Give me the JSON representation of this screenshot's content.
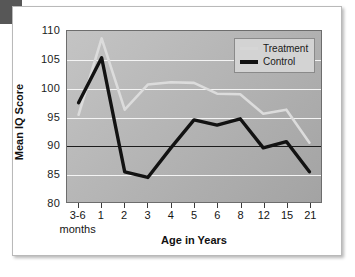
{
  "figure": {
    "corner_marker": "corner-block"
  },
  "chart_data": {
    "type": "line",
    "title": "",
    "xlabel": "Age in Years",
    "ylabel": "Mean IQ Score",
    "x_sub_label": "months",
    "categories": [
      "3-6",
      "1",
      "2",
      "3",
      "4",
      "5",
      "6",
      "8",
      "12",
      "15",
      "21"
    ],
    "ylim": [
      80,
      110
    ],
    "yticks": [
      110,
      105,
      100,
      95,
      90,
      85,
      80
    ],
    "grid": true,
    "reference_line": 90,
    "legend_position": "top-right",
    "series": [
      {
        "name": "Treatment",
        "color": "#dcdcdc",
        "values": [
          95.3,
          108.7,
          96.2,
          100.6,
          101.0,
          100.9,
          99.0,
          98.9,
          95.5,
          96.2,
          90.4
        ]
      },
      {
        "name": "Control",
        "color": "#121212",
        "values": [
          97.4,
          105.3,
          85.3,
          84.3,
          89.5,
          94.4,
          93.5,
          94.6,
          89.5,
          90.6,
          85.3
        ]
      }
    ]
  },
  "legend": {
    "items": [
      {
        "label": "Treatment"
      },
      {
        "label": "Control"
      }
    ]
  }
}
